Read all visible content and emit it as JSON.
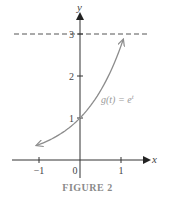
{
  "chart_data": {
    "type": "line",
    "title": "",
    "xlabel": "x",
    "ylabel": "y",
    "xlim": [
      -1.5,
      1.5
    ],
    "ylim": [
      0,
      3.3
    ],
    "x_ticks": [
      -1,
      0,
      1
    ],
    "x_tick_labels": [
      "−1",
      "0",
      "1"
    ],
    "y_ticks": [
      1,
      2,
      3
    ],
    "y_tick_labels": [
      "1",
      "2",
      "3"
    ],
    "grid": false,
    "series": [
      {
        "name": "g(t) = e^t",
        "function": "exp",
        "x_range": [
          -1.05,
          1.05
        ],
        "x": [
          -1.05,
          -0.5,
          0,
          0.5,
          1.0,
          1.05
        ],
        "values": [
          0.35,
          0.61,
          1.0,
          1.65,
          2.72,
          2.86
        ],
        "color": "#8c8c8c",
        "arrows_both_ends": true
      }
    ],
    "annotations": [
      {
        "type": "horizontal_dashed_line",
        "y": 3,
        "color": "#555555"
      },
      {
        "type": "point_label",
        "x": 0,
        "y": 1,
        "text": "1"
      }
    ],
    "legend": "none"
  },
  "labels": {
    "x_axis": "x",
    "y_axis": "y",
    "function_prefix": "g(t) = e",
    "function_exponent": "t",
    "x_tick_neg1": "−1",
    "x_tick_0": "0",
    "x_tick_1": "1",
    "y_tick_1": "1",
    "y_tick_2": "2",
    "y_tick_3": "3",
    "caption": "FIGURE 2"
  }
}
